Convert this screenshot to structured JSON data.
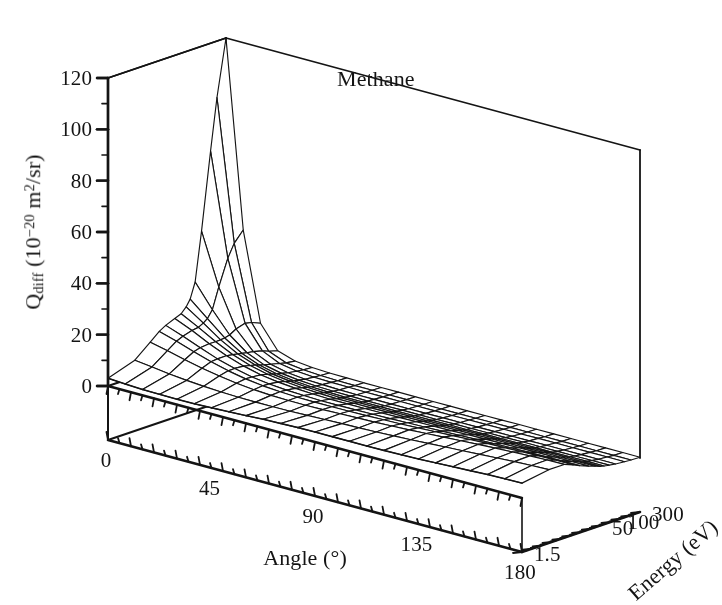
{
  "figure": {
    "annotation": "Methane",
    "background_color": "#ffffff",
    "line_color": "#141414",
    "width": 681,
    "height": 562
  },
  "chart_data": {
    "type": "surface",
    "title": "Methane",
    "xlabel": "Angle (°)",
    "ylabel": "Energy (eV)",
    "zlabel": "Qdiff (10^-20 m^2/sr)",
    "zlabel_parts": {
      "symbol": "Q",
      "subscript": "diff",
      "unit_prefix": " (10",
      "unit_exponent": "−20",
      "unit_mid": " m",
      "unit_sq": "2",
      "unit_suffix": "/sr)"
    },
    "xlabel_parts": {
      "text": "Angle (",
      "degree": "°",
      "close": ")"
    },
    "x": {
      "name": "Angle",
      "unit": "°",
      "ticks": [
        0,
        45,
        90,
        135,
        180
      ],
      "tick_labels": [
        "0",
        "45",
        "90",
        "135",
        "180"
      ],
      "minor_tick_count": 36,
      "range": [
        0,
        180
      ]
    },
    "y": {
      "name": "Energy",
      "unit": "eV",
      "ticks": [
        1.5,
        50,
        100,
        300
      ],
      "tick_labels": [
        "1.5",
        "50",
        "100",
        "300"
      ],
      "tick_positions_normalized": [
        0.0,
        0.47,
        0.67,
        1.0
      ],
      "minor_tick_count": 24,
      "range": [
        1.5,
        300
      ],
      "scale": "ordinal-log"
    },
    "z": {
      "name": "Qdiff",
      "unit": "10^-20 m^2/sr",
      "ticks": [
        0,
        20,
        40,
        60,
        80,
        100,
        120
      ],
      "tick_labels": [
        "0",
        "20",
        "40",
        "60",
        "80",
        "100",
        "120"
      ],
      "minor_tick_count": 12,
      "range": [
        0,
        120
      ],
      "grid": false
    },
    "mesh": {
      "angles": [
        0,
        7.5,
        15,
        22.5,
        30,
        37.5,
        45,
        52.5,
        60,
        67.5,
        75,
        82.5,
        90,
        97.5,
        105,
        112.5,
        120,
        127.5,
        135,
        142.5,
        150,
        157.5,
        165,
        172.5,
        180
      ],
      "energies": [
        1.5,
        5,
        10,
        15,
        20,
        30,
        40,
        50,
        60,
        75,
        100,
        150,
        200,
        300
      ],
      "values": [
        [
          3.0,
          2.6,
          2.3,
          2.2,
          2.1,
          2.2,
          2.4,
          2.7,
          3.0,
          3.4,
          3.6,
          3.8,
          3.9,
          3.9,
          3.9,
          3.9,
          4.0,
          4.1,
          4.3,
          4.6,
          4.9,
          5.2,
          5.5,
          5.7,
          5.8
        ],
        [
          6.5,
          5.7,
          4.8,
          4.1,
          3.6,
          3.2,
          3.0,
          2.9,
          2.9,
          3.0,
          3.2,
          3.4,
          3.6,
          3.8,
          4.0,
          4.3,
          4.6,
          5.0,
          5.4,
          5.8,
          6.2,
          6.6,
          7.0,
          7.3,
          7.5
        ],
        [
          11.5,
          10.0,
          8.3,
          6.8,
          5.6,
          4.6,
          3.9,
          3.5,
          3.3,
          3.3,
          3.4,
          3.6,
          3.8,
          4.0,
          4.3,
          4.6,
          5.0,
          5.4,
          5.8,
          6.2,
          6.6,
          6.9,
          7.2,
          7.4,
          7.5
        ],
        [
          14.5,
          12.5,
          10.2,
          8.1,
          6.4,
          5.1,
          4.2,
          3.7,
          3.4,
          3.3,
          3.3,
          3.4,
          3.5,
          3.7,
          3.9,
          4.2,
          4.5,
          4.8,
          5.1,
          5.4,
          5.6,
          5.8,
          6.0,
          6.1,
          6.1
        ],
        [
          16.0,
          13.6,
          10.9,
          8.4,
          6.5,
          5.0,
          4.1,
          3.5,
          3.2,
          3.0,
          3.0,
          3.1,
          3.2,
          3.3,
          3.5,
          3.7,
          3.9,
          4.1,
          4.3,
          4.5,
          4.7,
          4.8,
          4.9,
          5.0,
          5.0
        ],
        [
          17.5,
          14.6,
          11.3,
          8.4,
          6.2,
          4.6,
          3.6,
          3.0,
          2.6,
          2.4,
          2.4,
          2.4,
          2.5,
          2.6,
          2.7,
          2.8,
          2.9,
          3.1,
          3.2,
          3.3,
          3.4,
          3.5,
          3.5,
          3.6,
          3.6
        ],
        [
          18.5,
          15.0,
          11.2,
          8.0,
          5.6,
          4.0,
          3.0,
          2.4,
          2.0,
          1.8,
          1.8,
          1.8,
          1.9,
          1.9,
          2.0,
          2.1,
          2.2,
          2.3,
          2.4,
          2.5,
          2.5,
          2.6,
          2.6,
          2.7,
          2.7
        ],
        [
          20.5,
          16.0,
          11.3,
          7.6,
          5.1,
          3.4,
          2.5,
          1.9,
          1.6,
          1.4,
          1.4,
          1.4,
          1.4,
          1.5,
          1.5,
          1.6,
          1.7,
          1.8,
          1.8,
          1.9,
          1.9,
          2.0,
          2.0,
          2.0,
          2.0
        ],
        [
          23.0,
          17.2,
          11.5,
          7.3,
          4.6,
          3.0,
          2.1,
          1.6,
          1.3,
          1.1,
          1.1,
          1.1,
          1.1,
          1.2,
          1.2,
          1.3,
          1.3,
          1.4,
          1.4,
          1.5,
          1.5,
          1.5,
          1.6,
          1.6,
          1.6
        ],
        [
          29.0,
          20.0,
          12.0,
          6.9,
          4.0,
          2.5,
          1.7,
          1.2,
          1.0,
          0.9,
          0.8,
          0.8,
          0.9,
          0.9,
          0.9,
          1.0,
          1.0,
          1.1,
          1.1,
          1.2,
          1.2,
          1.2,
          1.2,
          1.3,
          1.3
        ],
        [
          48.0,
          28.0,
          13.5,
          6.5,
          3.4,
          1.9,
          1.2,
          0.9,
          0.7,
          0.6,
          0.6,
          0.6,
          0.6,
          0.6,
          0.7,
          0.7,
          0.7,
          0.8,
          0.8,
          0.8,
          0.9,
          0.9,
          0.9,
          0.9,
          0.9
        ],
        [
          78.0,
          38.0,
          14.5,
          5.6,
          2.5,
          1.3,
          0.8,
          0.6,
          0.5,
          0.4,
          0.4,
          0.4,
          0.4,
          0.4,
          0.4,
          0.5,
          0.5,
          0.5,
          0.5,
          0.6,
          0.6,
          0.6,
          0.6,
          0.6,
          0.6
        ],
        [
          98.0,
          43.0,
          14.0,
          4.6,
          1.9,
          1.0,
          0.6,
          0.4,
          0.3,
          0.3,
          0.3,
          0.3,
          0.3,
          0.3,
          0.3,
          0.3,
          0.4,
          0.4,
          0.4,
          0.4,
          0.4,
          0.4,
          0.4,
          0.4,
          0.4
        ],
        [
          120.0,
          47.0,
          12.5,
          3.6,
          1.4,
          0.7,
          0.4,
          0.3,
          0.2,
          0.2,
          0.2,
          0.2,
          0.2,
          0.2,
          0.2,
          0.2,
          0.2,
          0.3,
          0.3,
          0.3,
          0.3,
          0.3,
          0.3,
          0.3,
          0.3
        ]
      ],
      "peak_value": 120.0,
      "peak_angle": 0,
      "peak_energy": 300
    },
    "projection": {
      "origin_x": 108,
      "origin_y": 386,
      "floor_y": 440,
      "x_axis_vector": [
        414,
        112
      ],
      "y_axis_vector": [
        118,
        -40
      ],
      "depth_vector": [
        80,
        -95
      ],
      "z_height_px": 308
    }
  }
}
